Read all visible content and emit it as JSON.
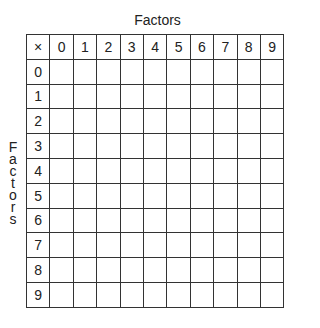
{
  "top_label": "Factors",
  "side_label": [
    "F",
    "a",
    "c",
    "t",
    "o",
    "r",
    "s"
  ],
  "corner": "×",
  "columns": [
    "0",
    "1",
    "2",
    "3",
    "4",
    "5",
    "6",
    "7",
    "8",
    "9"
  ],
  "rows": [
    "0",
    "1",
    "2",
    "3",
    "4",
    "5",
    "6",
    "7",
    "8",
    "9"
  ]
}
